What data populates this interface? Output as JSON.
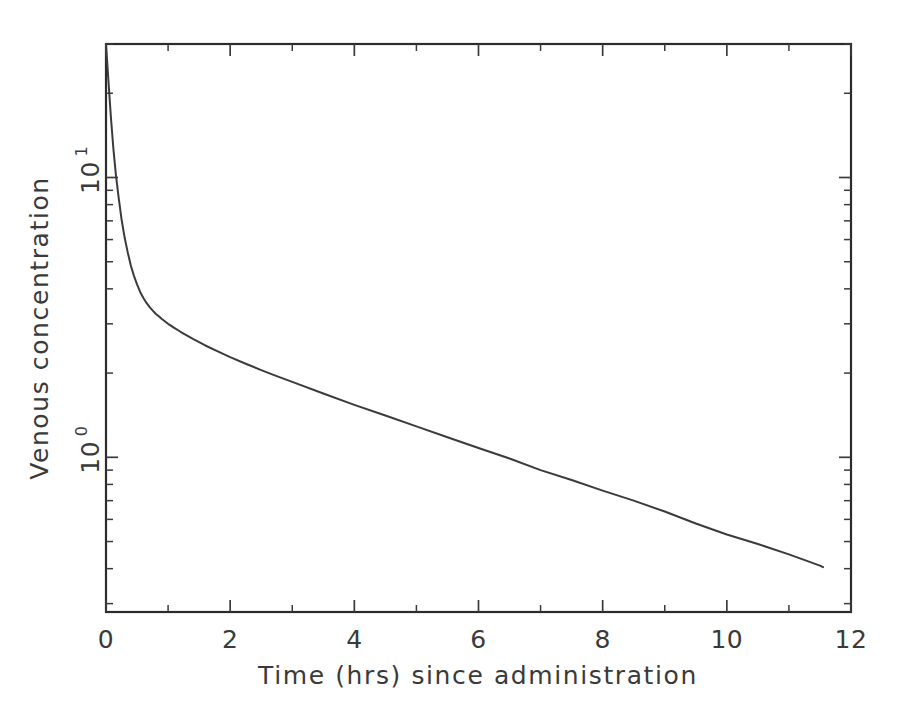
{
  "chart_data": {
    "type": "line",
    "title": "",
    "xlabel": "Time (hrs) since administration",
    "ylabel": "Venous concentration",
    "yscale": "log",
    "xscale": "linear",
    "xlim": [
      0,
      12
    ],
    "ylim": [
      0.28,
      30
    ],
    "xticks": [
      0,
      2,
      4,
      6,
      8,
      10,
      12
    ],
    "xticklabels": [
      "0",
      "2",
      "4",
      "6",
      "8",
      "10",
      "12"
    ],
    "xminorticks": [
      1,
      3,
      5,
      7,
      9,
      11
    ],
    "yticks": [
      1,
      10
    ],
    "yticklabels": [
      "10⁰",
      "10¹"
    ],
    "ytickbase": [
      "10",
      "10"
    ],
    "ytickexp": [
      "0",
      "1"
    ],
    "grid": false,
    "legend": null,
    "series": [
      {
        "name": "Venous concentration",
        "x": [
          0.0,
          0.04,
          0.08,
          0.12,
          0.16,
          0.2,
          0.25,
          0.3,
          0.35,
          0.4,
          0.45,
          0.5,
          0.55,
          0.6,
          0.65,
          0.7,
          0.75,
          0.8,
          0.85,
          0.9,
          1.0,
          1.1,
          1.2,
          1.4,
          1.6,
          1.8,
          2.0,
          2.25,
          2.5,
          2.75,
          3.0,
          3.5,
          4.0,
          4.5,
          5.0,
          5.5,
          6.0,
          6.5,
          7.0,
          7.5,
          8.0,
          8.5,
          9.0,
          9.5,
          10.0,
          10.5,
          11.0,
          11.5,
          11.55
        ],
        "y": [
          30.0,
          22.0,
          16.3,
          12.6,
          10.2,
          8.6,
          7.1,
          6.1,
          5.4,
          4.85,
          4.45,
          4.15,
          3.9,
          3.72,
          3.57,
          3.45,
          3.35,
          3.26,
          3.19,
          3.12,
          3.0,
          2.9,
          2.81,
          2.65,
          2.51,
          2.39,
          2.28,
          2.16,
          2.05,
          1.95,
          1.86,
          1.69,
          1.54,
          1.41,
          1.29,
          1.18,
          1.08,
          0.99,
          0.9,
          0.83,
          0.76,
          0.7,
          0.64,
          0.58,
          0.53,
          0.49,
          0.45,
          0.41,
          0.405
        ],
        "color": "#3b3b3b",
        "linewidth": 2.0,
        "marker": "none"
      }
    ],
    "annotations": []
  },
  "axes": {
    "box": {
      "left": 106,
      "right": 851,
      "top": 44,
      "bottom": 612
    },
    "spines": [
      "top",
      "right",
      "bottom",
      "left"
    ],
    "tick_direction": "in"
  },
  "colors": {
    "background": "#ffffff",
    "axis": "#2b2b2b",
    "text": "#3a3a3a",
    "curve": "#3b3b3b"
  }
}
